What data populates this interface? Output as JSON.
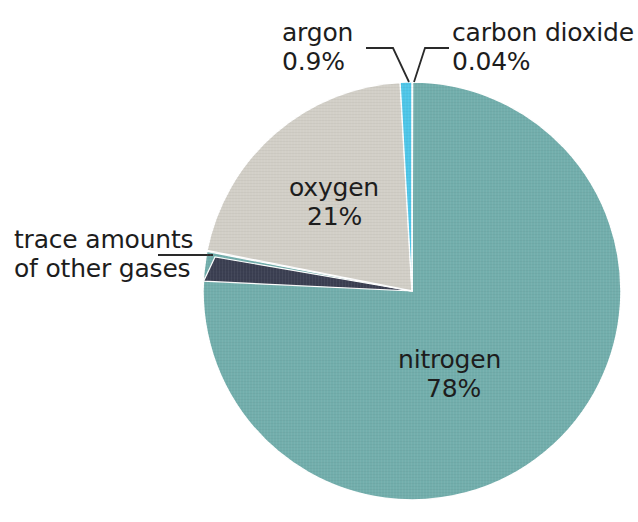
{
  "chart_data": {
    "type": "pie",
    "title": "",
    "subtitle": "",
    "xlabel": "",
    "ylabel": "",
    "legend_position": "none",
    "grid": false,
    "categories": [
      "nitrogen",
      "oxygen",
      "argon",
      "carbon dioxide",
      "trace amounts of other gases"
    ],
    "values": [
      78,
      21,
      0.9,
      0.04,
      0.06
    ],
    "series": [
      {
        "name": "Composition of air",
        "values": [
          78,
          21,
          0.9,
          0.04,
          0.06
        ]
      }
    ],
    "slices": [
      {
        "name": "nitrogen",
        "value_label": "78%",
        "value": 78,
        "color": "#72AEAC",
        "label_placement": "inside"
      },
      {
        "name": "oxygen",
        "value_label": "21%",
        "value": 21,
        "color": "#D2CFC7",
        "label_placement": "inside"
      },
      {
        "name": "argon",
        "value_label": "0.9%",
        "value": 0.9,
        "color": "#4EC6E8",
        "label_placement": "outside-leader"
      },
      {
        "name": "carbon dioxide",
        "value_label": "0.04%",
        "value": 0.04,
        "color": "#E4C3CC",
        "label_placement": "outside-leader"
      },
      {
        "name": "trace amounts of other gases",
        "value_label": "",
        "value": 0.06,
        "color": "#3B3F52",
        "label_placement": "outside-leader"
      }
    ]
  },
  "labels": {
    "argon": {
      "name": "argon",
      "value": "0.9%"
    },
    "carbon_dioxide": {
      "name": "carbon dioxide",
      "value": "0.04%"
    },
    "oxygen": {
      "name": "oxygen",
      "value": "21%"
    },
    "nitrogen": {
      "name": "nitrogen",
      "value": "78%"
    },
    "trace": {
      "line1": "trace amounts",
      "line2": "of other gases"
    }
  },
  "colors": {
    "background": "#FFFFFF",
    "nitrogen": "#72AEAC",
    "oxygen": "#D2CFC7",
    "argon": "#4EC6E8",
    "carbon_dioxide": "#E4C3CC",
    "trace": "#3B3F52",
    "text": "#1D1D1D",
    "leader_line": "#2A2A2A",
    "slice_outline": "#FFFFFF"
  },
  "geometry": {
    "center_x": 412,
    "center_y": 291,
    "radius": 209
  }
}
